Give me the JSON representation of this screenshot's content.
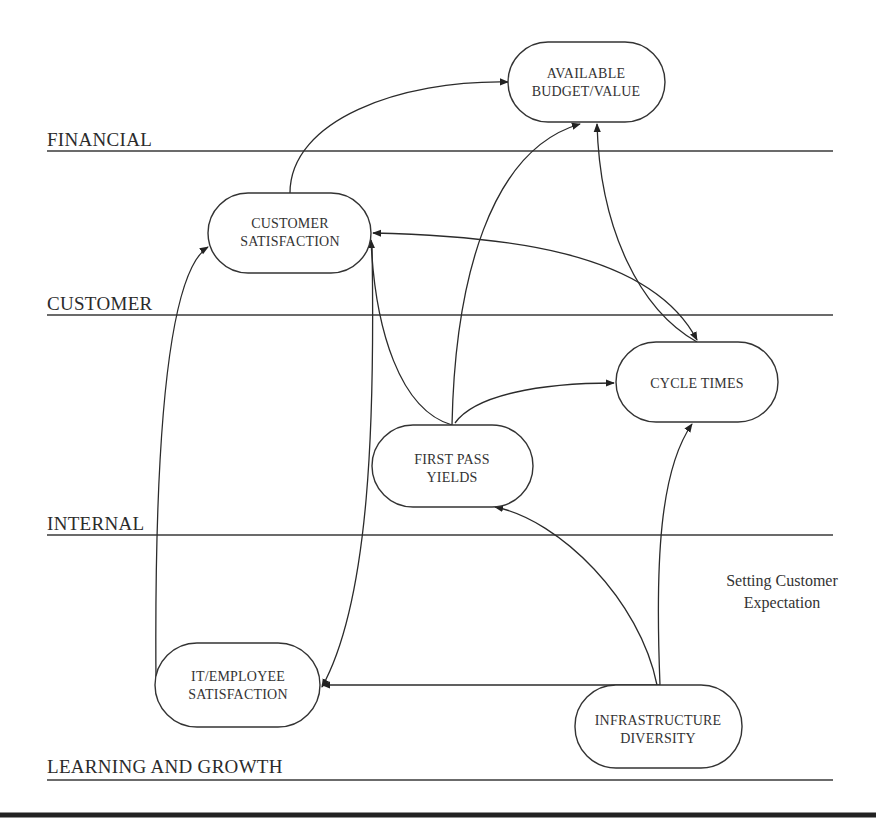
{
  "lanes": [
    {
      "id": "financial",
      "label": "FINANCIAL"
    },
    {
      "id": "customer",
      "label": "CUSTOMER"
    },
    {
      "id": "internal",
      "label": "INTERNAL"
    },
    {
      "id": "learning",
      "label": "LEARNING AND GROWTH"
    }
  ],
  "nodes": [
    {
      "id": "budget",
      "lines": [
        "AVAILABLE",
        "BUDGET/VALUE"
      ],
      "lane": "financial"
    },
    {
      "id": "custsat",
      "lines": [
        "CUSTOMER",
        "SATISFACTION"
      ],
      "lane": "customer"
    },
    {
      "id": "cycle",
      "lines": [
        "CYCLE TIMES"
      ],
      "lane": "internal"
    },
    {
      "id": "fpy",
      "lines": [
        "FIRST PASS",
        "YIELDS"
      ],
      "lane": "internal"
    },
    {
      "id": "itemp",
      "lines": [
        "IT/EMPLOYEE",
        "SATISFACTION"
      ],
      "lane": "learning"
    },
    {
      "id": "infra",
      "lines": [
        "INFRASTRUCTURE",
        "DIVERSITY"
      ],
      "lane": "learning"
    }
  ],
  "edges": [
    {
      "from": "custsat",
      "to": "budget",
      "direction": "forward"
    },
    {
      "from": "fpy",
      "to": "budget",
      "direction": "forward"
    },
    {
      "from": "cycle",
      "to": "budget",
      "direction": "both"
    },
    {
      "from": "custsat",
      "to": "cycle",
      "direction": "both"
    },
    {
      "from": "fpy",
      "to": "custsat",
      "direction": "forward"
    },
    {
      "from": "fpy",
      "to": "cycle",
      "direction": "forward"
    },
    {
      "from": "custsat",
      "to": "itemp",
      "direction": "forward"
    },
    {
      "from": "itemp",
      "to": "custsat",
      "direction": "forward"
    },
    {
      "from": "infra",
      "to": "itemp",
      "direction": "forward"
    },
    {
      "from": "infra",
      "to": "fpy",
      "direction": "forward"
    },
    {
      "from": "infra",
      "to": "cycle",
      "direction": "forward"
    }
  ],
  "annotation": {
    "lines": [
      "Setting Customer",
      "Expectation"
    ]
  }
}
